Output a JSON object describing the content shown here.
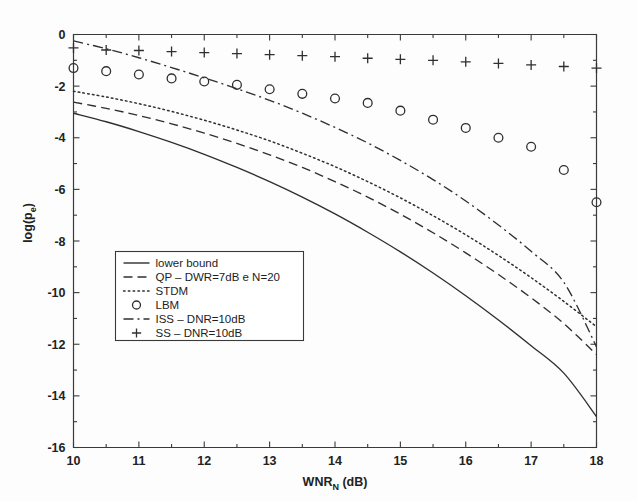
{
  "figure": {
    "background_color": "#fdfdfd",
    "ink_color": "#2f2f2f",
    "axis_color": "#3a3a3a"
  },
  "chart_data": {
    "type": "line",
    "title": "",
    "subtitle": "",
    "xlabel": "WNR_N (dB)",
    "xlabel_main": "WNR",
    "xlabel_sub": "N",
    "xlabel_unit": " (dB)",
    "ylabel": "log(p_e)",
    "ylabel_main": "log(p",
    "ylabel_sub": "e",
    "ylabel_tail": ")",
    "xlim": [
      10,
      18
    ],
    "ylim": [
      -16,
      0
    ],
    "xticks": [
      10,
      11,
      12,
      13,
      14,
      15,
      16,
      17,
      18
    ],
    "xtick_labels": [
      "10",
      "11",
      "12",
      "13",
      "14",
      "15",
      "16",
      "17",
      "18"
    ],
    "yticks": [
      0,
      -2,
      -4,
      -6,
      -8,
      -10,
      -12,
      -14,
      -16
    ],
    "ytick_labels": [
      "0",
      "-2",
      "-4",
      "-6",
      "-8",
      "-10",
      "-12",
      "-14",
      "-16"
    ],
    "xminor_step": 0.5,
    "yminor_step": 1,
    "grid": false,
    "legend_position": "center-left",
    "series": [
      {
        "name": "lower bound",
        "label": "lower bound",
        "style": "solid",
        "marker": "none",
        "dash": "none",
        "x": [
          10,
          10.5,
          11,
          11.5,
          12,
          12.5,
          13,
          13.5,
          14,
          14.5,
          15,
          15.5,
          16,
          16.5,
          17,
          17.5,
          18
        ],
        "y": [
          -3.05,
          -3.38,
          -3.76,
          -4.18,
          -4.64,
          -5.15,
          -5.7,
          -6.3,
          -6.95,
          -7.66,
          -8.42,
          -9.24,
          -10.12,
          -11.06,
          -12.06,
          -13.12,
          -14.8
        ]
      },
      {
        "name": "QP",
        "label": "QP – DWR=7dB e N=20",
        "style": "dashed",
        "marker": "none",
        "dash": "9,5",
        "x": [
          10,
          10.5,
          11,
          11.5,
          12,
          12.5,
          13,
          13.5,
          14,
          14.5,
          15,
          15.5,
          16,
          16.5,
          17,
          17.5,
          18
        ],
        "y": [
          -2.62,
          -2.86,
          -3.14,
          -3.46,
          -3.82,
          -4.22,
          -4.66,
          -5.15,
          -5.7,
          -6.3,
          -6.96,
          -7.68,
          -8.46,
          -9.3,
          -10.2,
          -11.2,
          -12.4
        ]
      },
      {
        "name": "STDM",
        "label": "STDM",
        "style": "dotted",
        "marker": "none",
        "dash": "1.6,3.2",
        "x": [
          10,
          10.5,
          11,
          11.5,
          12,
          12.5,
          13,
          13.5,
          14,
          14.5,
          15,
          15.5,
          16,
          16.5,
          17,
          17.5,
          18
        ],
        "y": [
          -2.2,
          -2.42,
          -2.68,
          -2.98,
          -3.32,
          -3.7,
          -4.12,
          -4.6,
          -5.12,
          -5.7,
          -6.33,
          -7.02,
          -7.76,
          -8.56,
          -9.42,
          -10.34,
          -11.32
        ]
      },
      {
        "name": "LBM",
        "label": "LBM",
        "style": "none",
        "marker": "circle",
        "dash": "none",
        "x": [
          10,
          10.5,
          11,
          11.5,
          12,
          12.5,
          13,
          13.5,
          14,
          14.5,
          15,
          15.5,
          16,
          16.5,
          17,
          17.5,
          18
        ],
        "y": [
          -1.3,
          -1.42,
          -1.55,
          -1.7,
          -1.82,
          -1.95,
          -2.12,
          -2.3,
          -2.48,
          -2.65,
          -2.95,
          -3.3,
          -3.62,
          -4.0,
          -4.35,
          -5.25,
          -6.5
        ]
      },
      {
        "name": "ISS",
        "label": "ISS – DNR=10dB",
        "style": "dashdot",
        "marker": "none",
        "dash": "10,4,2,4",
        "x": [
          10,
          10.5,
          11,
          11.5,
          12,
          12.5,
          13,
          13.5,
          14,
          14.5,
          15,
          15.5,
          16,
          16.5,
          17,
          17.5,
          18
        ],
        "y": [
          -0.25,
          -0.55,
          -0.9,
          -1.28,
          -1.68,
          -2.1,
          -2.55,
          -3.05,
          -3.6,
          -4.2,
          -4.88,
          -5.62,
          -6.45,
          -7.38,
          -8.4,
          -9.6,
          -12.1
        ]
      },
      {
        "name": "SS",
        "label": "SS – DNR=10dB",
        "style": "none",
        "marker": "plus",
        "dash": "none",
        "x": [
          10,
          10.5,
          11,
          11.5,
          12,
          12.5,
          13,
          13.5,
          14,
          14.5,
          15,
          15.5,
          16,
          16.5,
          17,
          17.5,
          18
        ],
        "y": [
          -0.52,
          -0.6,
          -0.62,
          -0.66,
          -0.7,
          -0.74,
          -0.78,
          -0.82,
          -0.86,
          -0.92,
          -0.96,
          -1.0,
          -1.06,
          -1.12,
          -1.18,
          -1.24,
          -1.3
        ]
      }
    ],
    "legend_entries": [
      {
        "label": "lower bound",
        "style": "solid",
        "marker": "none"
      },
      {
        "label": "QP – DWR=7dB e N=20",
        "style": "dashed",
        "marker": "none"
      },
      {
        "label": "STDM",
        "style": "dotted",
        "marker": "none"
      },
      {
        "label": "LBM",
        "style": "none",
        "marker": "circle"
      },
      {
        "label": "ISS – DNR=10dB",
        "style": "dashdot",
        "marker": "none"
      },
      {
        "label": "SS – DNR=10dB",
        "style": "none",
        "marker": "plus"
      }
    ]
  }
}
